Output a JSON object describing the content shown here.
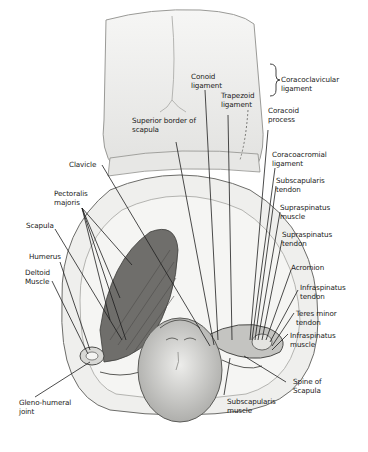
{
  "figure": {
    "labels": {
      "conoid_ligament": "Conoid\nligament",
      "coracoclavicular_ligament": "Coracoclavicular\nligament",
      "trapezoid_ligament": "Trapezoid\nligament",
      "coracoid_process": "Coracoid\nprocess",
      "superior_border_of_scapula": "Superior border of\nscapula",
      "coracoacromial_ligament": "Coracoacromial\nligament",
      "clavicle": "Clavicle",
      "subscapularis_tendon": "Subscapularis\ntendon",
      "pectoralis_majoris": "Pectoralis\nmajoris",
      "supraspinatus_muscle": "Supraspinatus\nmuscle",
      "scapula": "Scapula",
      "supraspinatus_tendon": "Supraspinatus\ntendon",
      "humerus": "Humerus",
      "deltoid_muscle": "Deltoid\nMuscle",
      "acromion": "Acromion",
      "infraspinatus_tendon": "Infraspinatus\ntendon",
      "teres_minor_tendon": "Teres minor\ntendon",
      "infraspinatus_muscle": "Infraspinatus\nmuscle",
      "gleno_humeral_joint": "Gleno-humeral\njoint",
      "spine_of_scapula": "Spine of\nScapula",
      "subscapularis_muscle": "Subscapularis\nmuscle"
    },
    "colors": {
      "background": "#ffffff",
      "skin": "#f1f1ef",
      "shade": "#c9c9c6",
      "muscle": "#6f6e6b",
      "line": "#1e1e1e",
      "text": "#1a1a1a"
    }
  }
}
